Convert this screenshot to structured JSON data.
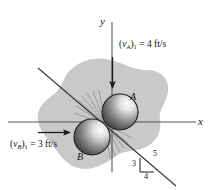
{
  "figure": {
    "axes": {
      "x_label": "x",
      "y_label": "y"
    },
    "bodies": [
      {
        "id": "A",
        "label": "A",
        "cx": 120,
        "cy": 112,
        "r": 18
      },
      {
        "id": "B",
        "label": "B",
        "cx": 92,
        "cy": 137,
        "r": 18
      }
    ],
    "velocities": [
      {
        "id": "vA",
        "symbol": "v",
        "subscript_body": "A",
        "subscript_state": "1",
        "equals": "=",
        "value": "4",
        "units": "ft/s",
        "text": "(vA)1 = 4 ft/s",
        "direction": "down"
      },
      {
        "id": "vB",
        "symbol": "v",
        "subscript_body": "B",
        "subscript_state": "1",
        "equals": "=",
        "value": "3",
        "units": "ft/s",
        "text": "(vB)1 = 3 ft/s",
        "direction": "right"
      }
    ],
    "slope_triangle": {
      "vertical": "3",
      "hypotenuse": "5",
      "horizontal": "4"
    },
    "colors": {
      "blob": "#c9c9c9",
      "line": "#3a3a3a",
      "axis": "#555555",
      "ball_light": "#f2f2f2",
      "ball_dark": "#2b2b2b",
      "text": "#111111"
    }
  }
}
